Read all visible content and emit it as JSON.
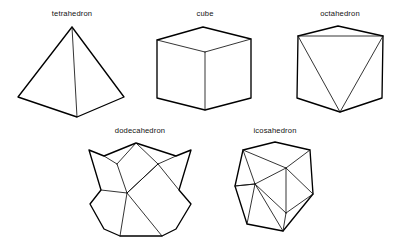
{
  "figure": {
    "width": 401,
    "height": 249,
    "background_color": "#ffffff",
    "stroke_color": "#000000",
    "label_color": "#111111",
    "style": "line drawing / wireframe"
  },
  "solids": [
    {
      "id": "tetrahedron",
      "label": "tetrahedron",
      "faces": 4,
      "face_shape": "triangle",
      "label_x": 72,
      "label_y": 16,
      "outline": "72,27 18,97 77,117 124,97",
      "inner_edges": [
        "72,27 77,117"
      ],
      "row": 1,
      "column": 1
    },
    {
      "id": "cube",
      "label": "cube",
      "faces": 6,
      "face_shape": "square",
      "label_x": 205,
      "label_y": 16,
      "outline": "157,40 203,27 251,39 251,98 205,110 157,98",
      "inner_edges": [
        "157,40 205,52",
        "251,39 205,52",
        "205,52 205,110"
      ],
      "row": 1,
      "column": 2
    },
    {
      "id": "octahedron",
      "label": "octahedron",
      "faces": 8,
      "face_shape": "triangle",
      "label_x": 340,
      "label_y": 16,
      "outline": "338,26 383,36 382,98 340,112 297,98 298,36",
      "inner_edges": [
        "298,36 383,36",
        "298,36 340,112",
        "383,36 340,112"
      ],
      "row": 1,
      "column": 3
    },
    {
      "id": "dodecahedron",
      "label": "dodecahedron",
      "faces": 12,
      "face_shape": "pentagon",
      "label_x": 140,
      "label_y": 133,
      "outline": "136,143 176,156 191,150 179,190 191,204 176,229 162,236 120,236 104,229 90,204 101,190 89,150 104,156",
      "inner_edges": [
        "117,164 136,143 158,164",
        "117,164 127,193 158,164",
        "127,193 101,190",
        "127,193 158,164",
        "158,164 179,190",
        "127,193 120,236",
        "127,193 162,236",
        "117,164 104,156",
        "158,164 176,156"
      ],
      "row": 2,
      "column": 1
    },
    {
      "id": "icosahedron",
      "label": "icosahedron",
      "faces": 20,
      "face_shape": "triangle",
      "label_x": 275,
      "label_y": 133,
      "outline": "243,150 275,142 310,150 313,194 283,231 247,224 235,186",
      "inner_edges": [
        "243,150 286,168",
        "286,168 310,150",
        "243,150 255,184",
        "255,184 286,168",
        "255,184 235,186",
        "286,168 286,213",
        "255,184 286,213",
        "286,213 313,194",
        "286,213 283,231",
        "255,184 283,231",
        "255,184 247,224",
        "286,168 313,194",
        "235,186 255,184"
      ],
      "row": 2,
      "column": 2
    }
  ]
}
